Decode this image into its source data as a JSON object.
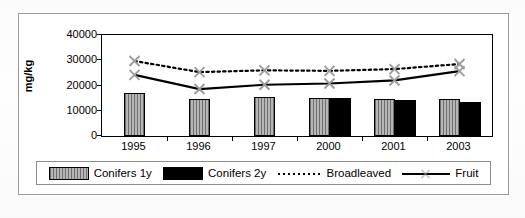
{
  "chart_data": {
    "type": "bar",
    "title": "",
    "subtitle": "",
    "xlabel": "",
    "ylabel": "mg/kg",
    "categories": [
      "1995",
      "1996",
      "1997",
      "2000",
      "2001",
      "2003"
    ],
    "ylim": [
      0,
      40000
    ],
    "yticks": [
      0,
      10000,
      20000,
      30000,
      40000
    ],
    "ytick_labels": [
      "0",
      "10000",
      "20000",
      "30000",
      "40000"
    ],
    "grid": false,
    "legend_position": "bottom",
    "series": [
      {
        "name": "Conifers 1y",
        "kind": "bar",
        "style": "gray-hatched",
        "values": [
          17000,
          14500,
          15500,
          15000,
          14500,
          14500
        ]
      },
      {
        "name": "Conifers 2y",
        "kind": "bar",
        "style": "solid-black",
        "values": [
          null,
          null,
          null,
          15200,
          14300,
          13500
        ]
      },
      {
        "name": "Broadleaved",
        "kind": "line",
        "style": "dotted",
        "values": [
          29700,
          25300,
          26000,
          25800,
          26500,
          28500
        ]
      },
      {
        "name": "Fruit",
        "kind": "line",
        "style": "solid-with-x-marker",
        "values": [
          24200,
          18600,
          20300,
          20800,
          22000,
          25700
        ]
      }
    ]
  },
  "legend": {
    "items": [
      {
        "label": "Conifers 1y",
        "swatch": "gray-hatched-swatch"
      },
      {
        "label": "Conifers 2y",
        "swatch": "black-swatch"
      },
      {
        "label": "Broadleaved",
        "swatch": "dotted-line-swatch"
      },
      {
        "label": "Fruit",
        "swatch": "solid-line-x-marker-swatch"
      }
    ]
  },
  "colors": {
    "bar_gray_dark": "#6e6e6e",
    "bar_gray_light": "#b6b6b6",
    "bar_black": "#000000",
    "line": "#000000",
    "frame": "#9a9a9a",
    "background": "#ffffff"
  }
}
